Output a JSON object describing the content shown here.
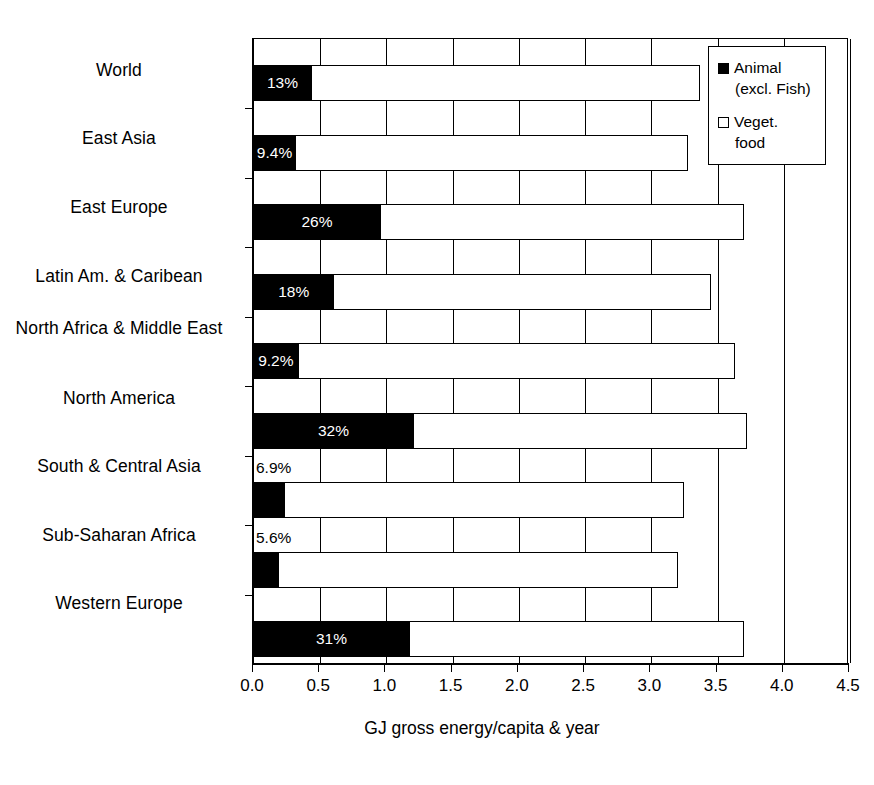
{
  "chart_data": {
    "type": "bar",
    "title": "",
    "subtitle": "",
    "orientation": "horizontal",
    "stacked": true,
    "xlabel": "GJ gross energy/capita & year",
    "ylabel": "",
    "xlim": [
      0.0,
      4.5
    ],
    "xticks": [
      "0.0",
      "0.5",
      "1.0",
      "1.5",
      "2.0",
      "2.5",
      "3.0",
      "3.5",
      "4.0",
      "4.5"
    ],
    "grid": "vertical",
    "legend_position": "top-right",
    "categories": [
      "World",
      "East Asia",
      "East Europe",
      "Latin Am. & Caribean",
      "North Africa & Middle East",
      "North America",
      "South & Central Asia",
      "Sub-Saharan Africa",
      "Western Europe"
    ],
    "series": [
      {
        "name": "Animal (excl. Fish)",
        "color": "#000000",
        "values": [
          0.43,
          0.31,
          0.95,
          0.6,
          0.33,
          1.2,
          0.23,
          0.18,
          1.17
        ]
      },
      {
        "name": "Veget. food",
        "color": "#ffffff",
        "values": [
          2.94,
          2.97,
          2.75,
          2.85,
          3.3,
          2.52,
          3.02,
          3.02,
          2.53
        ]
      }
    ],
    "totals": [
      3.37,
      3.28,
      3.7,
      3.45,
      3.63,
      3.72,
      3.25,
      3.2,
      3.7
    ],
    "data_labels": [
      "13%",
      "9.4%",
      "26%",
      "18%",
      "9.2%",
      "32%",
      "6.9%",
      "5.6%",
      "31%"
    ],
    "data_label_placement": [
      "inside",
      "inside",
      "inside",
      "inside",
      "inside",
      "inside",
      "outside",
      "outside",
      "inside"
    ]
  },
  "legend": {
    "items": [
      {
        "marker": "filled-square-icon",
        "line1": "Animal",
        "line2": "(excl. Fish)"
      },
      {
        "marker": "open-square-icon",
        "line1": "Veget.",
        "line2": "food"
      }
    ]
  },
  "axis": {
    "xlabel": "GJ gross energy/capita & year"
  }
}
